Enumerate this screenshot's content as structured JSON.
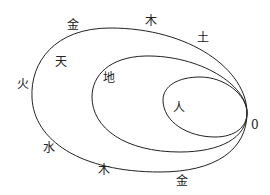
{
  "labels": {
    "jin_top": "金",
    "mu_top": "木",
    "tu": "土",
    "tian": "天",
    "huo": "火",
    "di": "地",
    "ren": "人",
    "zero": "0",
    "shui": "水",
    "mu_bottom": "木",
    "jin_bottom": "金"
  },
  "colors": {
    "stroke": "#222222",
    "background": "#ffffff"
  }
}
